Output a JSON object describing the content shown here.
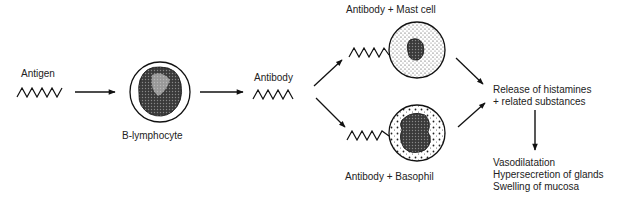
{
  "diagram": {
    "labels": {
      "antigen": "Antigen",
      "b_lymphocyte": "B-lymphocyte",
      "antibody": "Antibody",
      "antibody_mast_cell": "Antibody + Mast cell",
      "antibody_basophil": "Antibody + Basophil",
      "release_line1": "Release of histamines",
      "release_line2": "+ related substances",
      "effects": [
        "Vasodilatation",
        "Hypersecretion of glands",
        "Swelling of mucosa"
      ]
    },
    "nodes": [
      {
        "id": "antigen",
        "type": "zigzag"
      },
      {
        "id": "b-lymphocyte",
        "type": "cell"
      },
      {
        "id": "antibody",
        "type": "zigzag"
      },
      {
        "id": "mast-cell",
        "type": "cell",
        "bound_to": "antibody"
      },
      {
        "id": "basophil",
        "type": "cell",
        "bound_to": "antibody"
      },
      {
        "id": "histamine-release",
        "type": "text"
      },
      {
        "id": "effects",
        "type": "text-list"
      }
    ],
    "edges": [
      {
        "from": "antigen",
        "to": "b-lymphocyte"
      },
      {
        "from": "b-lymphocyte",
        "to": "antibody"
      },
      {
        "from": "antibody",
        "to": "mast-cell"
      },
      {
        "from": "antibody",
        "to": "basophil"
      },
      {
        "from": "mast-cell",
        "to": "histamine-release"
      },
      {
        "from": "basophil",
        "to": "histamine-release"
      },
      {
        "from": "histamine-release",
        "to": "effects"
      }
    ]
  }
}
